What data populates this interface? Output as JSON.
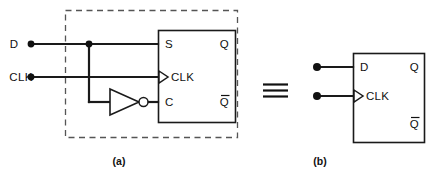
{
  "figure": {
    "equivalence_symbol": "≡"
  },
  "panel_a": {
    "caption": "(a)",
    "inputs": [
      {
        "label": "D",
        "terminal": "input-terminal-d"
      },
      {
        "label": "CLK",
        "terminal": "input-terminal-clk"
      }
    ],
    "flipflop": {
      "pins_left": [
        "S",
        "CLK",
        "C"
      ],
      "pins_right": [
        "Q",
        "Q̅"
      ],
      "q_label": "Q",
      "qbar_label": "Q",
      "clk_pin_label": "CLK",
      "s_pin_label": "S",
      "c_pin_label": "C"
    },
    "inverter": {
      "name": "not-gate",
      "label": ""
    },
    "boundary": "dashed"
  },
  "panel_b": {
    "caption": "(b)",
    "inputs": [
      {
        "label": "D",
        "terminal": "input-terminal-d"
      },
      {
        "label": "CLK",
        "terminal": "input-terminal-clk"
      }
    ],
    "flipflop": {
      "pins_left": [
        "D",
        "CLK"
      ],
      "pins_right": [
        "Q",
        "Q̅"
      ],
      "d_pin_label": "D",
      "clk_pin_label": "CLK",
      "q_label": "Q",
      "qbar_label": "Q"
    }
  },
  "colors": {
    "wire": "#1a1a1a",
    "outline": "#1a1a1a",
    "dashed": "#555555",
    "background": "#ffffff"
  }
}
